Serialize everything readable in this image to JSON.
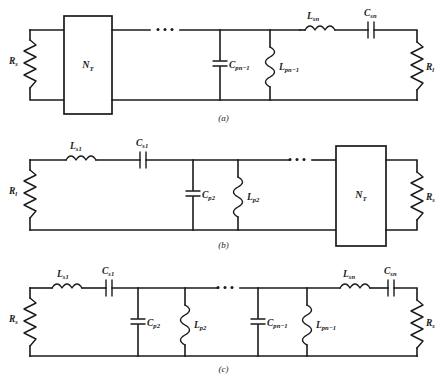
{
  "figure": {
    "background_color": "#ffffff",
    "line_color": "#1a1a1a"
  },
  "panels": [
    {
      "id": "a",
      "caption": "(a)",
      "source_resistor": {
        "symbol": "R",
        "subscript": "s"
      },
      "load_resistor": {
        "symbol": "R",
        "subscript": "l"
      },
      "transformer_box": {
        "symbol": "N",
        "subscript": "T"
      },
      "ellipsis": "• • •",
      "components": [
        {
          "type": "capacitor",
          "symbol": "C",
          "subscript": "pn−1",
          "orientation": "shunt"
        },
        {
          "type": "inductor",
          "symbol": "L",
          "subscript": "pn−1",
          "orientation": "shunt"
        },
        {
          "type": "inductor",
          "symbol": "L",
          "subscript": "sn",
          "orientation": "series"
        },
        {
          "type": "capacitor",
          "symbol": "C",
          "subscript": "sn",
          "orientation": "series"
        }
      ]
    },
    {
      "id": "b",
      "caption": "(b)",
      "source_resistor": {
        "symbol": "R",
        "subscript": "l"
      },
      "load_resistor": {
        "symbol": "R",
        "subscript": "s"
      },
      "transformer_box": {
        "symbol": "N",
        "subscript": "T"
      },
      "ellipsis": "• • •",
      "components": [
        {
          "type": "inductor",
          "symbol": "L",
          "subscript": "s1",
          "orientation": "series"
        },
        {
          "type": "capacitor",
          "symbol": "C",
          "subscript": "s1",
          "orientation": "series"
        },
        {
          "type": "capacitor",
          "symbol": "C",
          "subscript": "p2",
          "orientation": "shunt"
        },
        {
          "type": "inductor",
          "symbol": "L",
          "subscript": "p2",
          "orientation": "shunt"
        }
      ]
    },
    {
      "id": "c",
      "caption": "(c)",
      "source_resistor": {
        "symbol": "R",
        "subscript": "s"
      },
      "load_resistor": {
        "symbol": "R",
        "subscript": "s"
      },
      "transformer_box": null,
      "ellipsis": "• • •",
      "components": [
        {
          "type": "inductor",
          "symbol": "L",
          "subscript": "s1",
          "orientation": "series"
        },
        {
          "type": "capacitor",
          "symbol": "C",
          "subscript": "s1",
          "orientation": "series"
        },
        {
          "type": "capacitor",
          "symbol": "C",
          "subscript": "p2",
          "orientation": "shunt"
        },
        {
          "type": "inductor",
          "symbol": "L",
          "subscript": "p2",
          "orientation": "shunt"
        },
        {
          "type": "capacitor",
          "symbol": "C",
          "subscript": "pn−1",
          "orientation": "shunt"
        },
        {
          "type": "inductor",
          "symbol": "L",
          "subscript": "pn−1",
          "orientation": "shunt"
        },
        {
          "type": "inductor",
          "symbol": "L",
          "subscript": "sn",
          "orientation": "series"
        },
        {
          "type": "capacitor",
          "symbol": "C",
          "subscript": "sn",
          "orientation": "series"
        }
      ]
    }
  ],
  "labels": {
    "a": {
      "Rs": "R",
      "Rs_sub": "s",
      "Rl": "R",
      "Rl_sub": "l",
      "NT": "N",
      "NT_sub": "T",
      "Cpn1": "C",
      "Cpn1_sub": "pn−1",
      "Lpn1": "L",
      "Lpn1_sub": "pn−1",
      "Lsn": "L",
      "Lsn_sub": "sn",
      "Csn": "C",
      "Csn_sub": "sn",
      "caption": "(a)"
    },
    "b": {
      "Rl": "R",
      "Rl_sub": "l",
      "Rs": "R",
      "Rs_sub": "s",
      "NT": "N",
      "NT_sub": "T",
      "Ls1": "L",
      "Ls1_sub": "s1",
      "Cs1": "C",
      "Cs1_sub": "s1",
      "Cp2": "C",
      "Cp2_sub": "p2",
      "Lp2": "L",
      "Lp2_sub": "p2",
      "caption": "(b)"
    },
    "c": {
      "Rs_left": "R",
      "Rs_left_sub": "s",
      "Rs_right": "R",
      "Rs_right_sub": "s",
      "Ls1": "L",
      "Ls1_sub": "s1",
      "Cs1": "C",
      "Cs1_sub": "s1",
      "Cp2": "C",
      "Cp2_sub": "p2",
      "Lp2": "L",
      "Lp2_sub": "p2",
      "Cpn1": "C",
      "Cpn1_sub": "pn−1",
      "Lpn1": "L",
      "Lpn1_sub": "pn−1",
      "Lsn": "L",
      "Lsn_sub": "sn",
      "Csn": "C",
      "Csn_sub": "sn",
      "caption": "(c)"
    }
  }
}
